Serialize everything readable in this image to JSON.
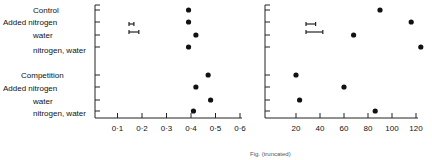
{
  "chart_data": [
    {
      "type": "scatter",
      "panel": "left",
      "categories": [
        "Control",
        "Added nitrogen",
        "water",
        "nitrogen, water",
        "Competition",
        "Added nitrogen",
        "water",
        "nitrogen, water"
      ],
      "values": [
        0.39,
        0.39,
        0.42,
        0.39,
        0.47,
        0.42,
        0.48,
        0.41
      ],
      "xlim": [
        0,
        0.6
      ],
      "xticks": [
        "0·1",
        "0·2",
        "0·3",
        "0·4",
        "0·5",
        "0·6"
      ],
      "error_bars": [
        {
          "half_width": 0.01
        },
        {
          "half_width": 0.02
        }
      ],
      "xlabel": "",
      "ylabel": ""
    },
    {
      "type": "scatter",
      "panel": "right",
      "categories": [
        "Control",
        "Added nitrogen",
        "water",
        "nitrogen, water",
        "Competition",
        "Added nitrogen",
        "water",
        "nitrogen, water"
      ],
      "values": [
        90,
        116,
        68,
        124,
        20,
        60,
        23,
        86
      ],
      "xlim": [
        0,
        125
      ],
      "xticks": [
        "20",
        "40",
        "60",
        "80",
        "100",
        "120"
      ],
      "error_bars": [
        {
          "half_width": 4
        },
        {
          "half_width": 7
        }
      ],
      "xlabel": "",
      "ylabel": ""
    }
  ],
  "labels": {
    "rows": [
      "Control",
      "Added nitrogen",
      "water",
      "nitrogen, water",
      "Competition",
      "Added nitrogen",
      "water",
      "nitrogen, water"
    ]
  },
  "footer": "Fig. (truncated)"
}
